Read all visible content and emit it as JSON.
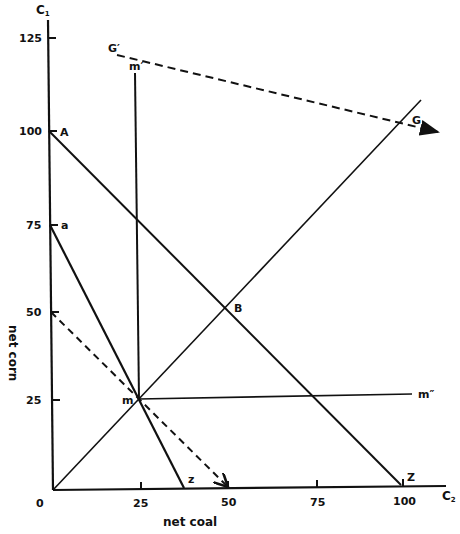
{
  "diagram": {
    "axes": {
      "y_axis_label": "C",
      "y_axis_sub": "1",
      "x_axis_label": "C",
      "x_axis_sub": "2",
      "y_title": "net corn",
      "x_title": "net coal",
      "origin_label": "0",
      "y_ticks": [
        "125",
        "100",
        "75",
        "50",
        "25"
      ],
      "x_ticks": [
        "25",
        "50",
        "75",
        "100"
      ]
    },
    "points": {
      "A": "A",
      "a": "a",
      "m": "m",
      "m_prime": "m′",
      "m_double_prime": "m″",
      "B": "B",
      "G": "G",
      "G_prime": "G′",
      "z": "z",
      "Z": "Z"
    },
    "lines": [
      {
        "name": "A-Z",
        "from": [
          0,
          100
        ],
        "to": [
          100,
          0
        ],
        "style": "solid"
      },
      {
        "name": "a-z",
        "from": [
          0,
          75
        ],
        "to": [
          37.5,
          0
        ],
        "style": "solid"
      },
      {
        "name": "dashed-50",
        "from": [
          0,
          50
        ],
        "to": [
          50,
          0
        ],
        "style": "dashed"
      },
      {
        "name": "0-G",
        "from": [
          0,
          0
        ],
        "to": [
          105,
          110
        ],
        "style": "solid"
      },
      {
        "name": "m-m'",
        "from": [
          25,
          25
        ],
        "to": [
          25,
          115
        ],
        "style": "solid"
      },
      {
        "name": "m-m''",
        "from": [
          25,
          25
        ],
        "to": [
          110,
          26
        ],
        "style": "solid"
      },
      {
        "name": "G'-G",
        "from": [
          17,
          120
        ],
        "to": [
          110,
          100
        ],
        "style": "dashed-arrow"
      }
    ]
  }
}
